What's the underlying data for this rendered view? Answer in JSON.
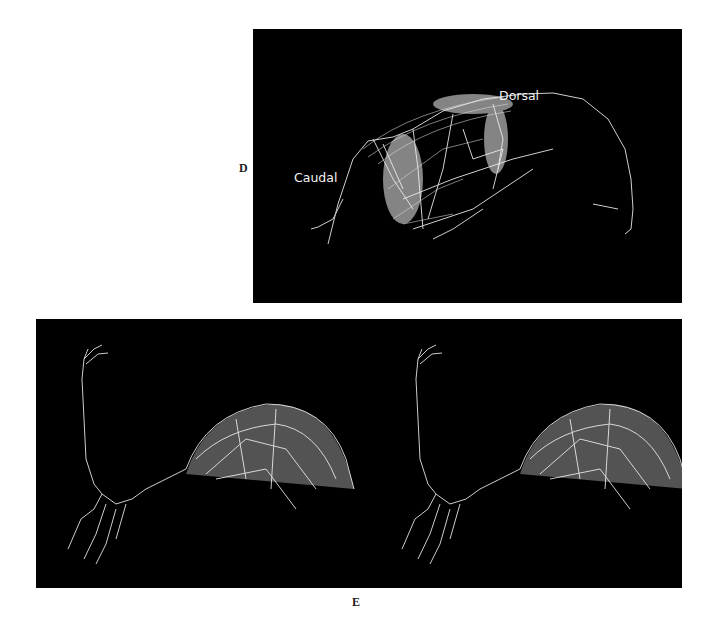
{
  "figure": {
    "panels": [
      {
        "label": "D",
        "annotations": {
          "caudal": "Caudal",
          "dorsal": "Dorsal"
        },
        "description": "3D reconstruction of neuronal arbor on black background"
      },
      {
        "label": "E",
        "description": "Stereo pair of 3D neuronal arbor reconstruction on black background"
      }
    ],
    "colors": {
      "background": "#000000",
      "neurites": "#e8e8e8",
      "page": "#ffffff"
    }
  }
}
